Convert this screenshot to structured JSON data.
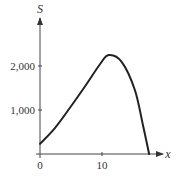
{
  "chart_data": {
    "type": "line",
    "title": "",
    "xlabel": "x",
    "ylabel": "S",
    "xlim": [
      0,
      20
    ],
    "ylim": [
      0,
      2700
    ],
    "x_ticks": [
      0,
      10
    ],
    "x_tick_labels": [
      "0",
      "10"
    ],
    "y_ticks": [
      1000,
      2000
    ],
    "y_tick_labels": [
      "1,000",
      "2,000"
    ],
    "grid": false,
    "legend": null,
    "series": [
      {
        "name": "S(x)",
        "color": "#222222",
        "x": [
          0,
          2.4,
          4.8,
          7.3,
          9.7,
          11.1,
          13.2,
          15.3,
          16.6,
          17.6
        ],
        "values": [
          230,
          590,
          1045,
          1545,
          2045,
          2250,
          2090,
          1455,
          660,
          0
        ]
      }
    ],
    "annotations": []
  },
  "layout": {
    "origin_px": [
      40,
      154
    ],
    "px_per_x": 6.2,
    "px_per_y": 0.044,
    "x_axis_end_px": 163,
    "y_axis_top_px": 18,
    "axis_color": "#444444",
    "curve_color": "#222222"
  }
}
